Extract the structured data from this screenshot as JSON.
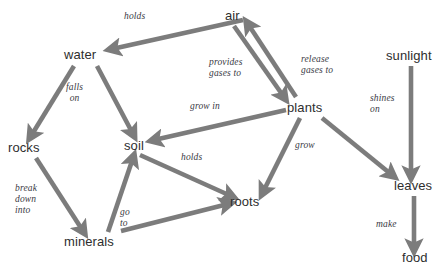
{
  "diagram": {
    "type": "concept-map",
    "arrow_color": "#7c7c7c",
    "node_text_color": "#2e2e2e",
    "label_text_color": "#3a3a44",
    "background": "#ffffff",
    "nodes": [
      {
        "id": "air",
        "label": "air"
      },
      {
        "id": "water",
        "label": "water"
      },
      {
        "id": "sunlight",
        "label": "sunlight"
      },
      {
        "id": "plants",
        "label": "plants"
      },
      {
        "id": "rocks",
        "label": "rocks"
      },
      {
        "id": "soil",
        "label": "soil"
      },
      {
        "id": "leaves",
        "label": "leaves"
      },
      {
        "id": "roots",
        "label": "roots"
      },
      {
        "id": "minerals",
        "label": "minerals"
      },
      {
        "id": "food",
        "label": "food"
      }
    ],
    "edges": [
      {
        "id": "air-water",
        "from": "air",
        "to": "water",
        "label": "holds"
      },
      {
        "id": "air-plants",
        "from": "air",
        "to": "plants",
        "label": "provides\ngases to"
      },
      {
        "id": "plants-air",
        "from": "plants",
        "to": "air",
        "label": "release\ngases to"
      },
      {
        "id": "water-rocks",
        "from": "water",
        "to": "rocks",
        "label": "falls\non"
      },
      {
        "id": "water-soil",
        "from": "water",
        "to": "soil",
        "label": ""
      },
      {
        "id": "plants-soil",
        "from": "plants",
        "to": "soil",
        "label": "grow in"
      },
      {
        "id": "plants-roots",
        "from": "plants",
        "to": "roots",
        "label": "grow"
      },
      {
        "id": "plants-leaves",
        "from": "plants",
        "to": "leaves",
        "label": ""
      },
      {
        "id": "soil-roots",
        "from": "soil",
        "to": "roots",
        "label": "holds"
      },
      {
        "id": "rocks-minerals",
        "from": "rocks",
        "to": "minerals",
        "label": "break\ndown\ninto"
      },
      {
        "id": "minerals-soil",
        "from": "minerals",
        "to": "soil",
        "label": ""
      },
      {
        "id": "minerals-roots",
        "from": "minerals",
        "to": "roots",
        "label": "go\nto"
      },
      {
        "id": "sunlight-leaves",
        "from": "sunlight",
        "to": "leaves",
        "label": "shines\non"
      },
      {
        "id": "leaves-food",
        "from": "leaves",
        "to": "food",
        "label": "make"
      }
    ],
    "edge_labels": {
      "holds_top": "holds",
      "provides_gases_to_1": "provides",
      "provides_gases_to_2": "gases to",
      "release_gases_to_1": "release",
      "release_gases_to_2": "gases to",
      "falls_1": "falls",
      "falls_2": "on",
      "grow_in": "grow in",
      "grow": "grow",
      "holds_mid": "holds",
      "break_1": "break",
      "break_2": "down",
      "break_3": "into",
      "go_1": "go",
      "go_2": "to",
      "shines_1": "shines",
      "shines_2": "on",
      "make": "make"
    }
  }
}
